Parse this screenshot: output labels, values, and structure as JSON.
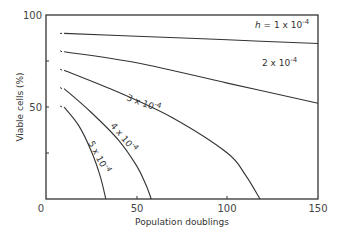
{
  "chart_data": {
    "type": "line",
    "title": "",
    "xlabel": "Population doublings",
    "ylabel": "Viable cells (%)",
    "xlim": [
      0,
      150
    ],
    "ylim": [
      0,
      100
    ],
    "xticks": [
      "0",
      "50",
      "100",
      "150"
    ],
    "yticks": [
      "50",
      "100"
    ],
    "grid": false,
    "legend": "inline curve labels",
    "series": [
      {
        "name": "h = 1 x 10^-4",
        "label": "h = 1 x 10",
        "exp": "-4",
        "x": [
          10,
          50,
          100,
          150
        ],
        "y": [
          90,
          88.5,
          86.5,
          84.5
        ]
      },
      {
        "name": "2 x 10^-4",
        "label": "2 x 10",
        "exp": "-4",
        "x": [
          10,
          50,
          100,
          150
        ],
        "y": [
          80,
          74,
          63,
          52
        ]
      },
      {
        "name": "3 x 10^-4",
        "label": "3 x 10",
        "exp": "-4",
        "x": [
          10,
          40,
          70,
          100,
          110,
          118
        ],
        "y": [
          70,
          58,
          44,
          25,
          13,
          0
        ]
      },
      {
        "name": "4 x 10^-4",
        "label": "4 x 10",
        "exp": "-4",
        "x": [
          10,
          25,
          40,
          50,
          55,
          58
        ],
        "y": [
          60,
          47,
          32,
          18,
          8,
          0
        ]
      },
      {
        "name": "5 x 10^-4",
        "label": "5 x 10",
        "exp": "-4",
        "x": [
          10,
          18,
          25,
          30,
          33
        ],
        "y": [
          50,
          40,
          26,
          12,
          0
        ]
      }
    ]
  }
}
